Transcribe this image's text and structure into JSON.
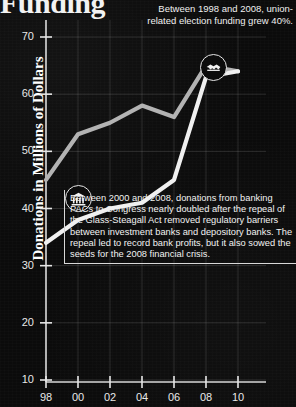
{
  "title": "Funding",
  "chart_data": {
    "type": "line",
    "title": "Funding",
    "xlabel": "",
    "ylabel": "Donations in Millions of Dollars",
    "x": [
      "98",
      "00",
      "02",
      "04",
      "06",
      "08",
      "10"
    ],
    "xtick_labels": [
      "98",
      "00",
      "02",
      "04",
      "06",
      "08",
      "10"
    ],
    "ytick_labels": [
      "70",
      "60",
      "50",
      "40",
      "30",
      "20",
      "10"
    ],
    "ylim": [
      10,
      70
    ],
    "grid": true,
    "legend": "none",
    "series": [
      {
        "name": "union-related election funding",
        "color": "#b3b3b3",
        "values": [
          45,
          53,
          55,
          58,
          56,
          65,
          64
        ]
      },
      {
        "name": "banking PAC donations to Congress",
        "color": "#f0f0f0",
        "values": [
          34,
          38,
          40,
          41,
          45,
          63,
          64
        ]
      }
    ],
    "annotations": [
      {
        "id": "union-note",
        "icon": "handshake-icon",
        "text": "Between 1998 and 2008, union-related election funding grew 40%."
      },
      {
        "id": "banking-note",
        "icon": "bank-icon",
        "text": "Between 2000 and 2008, donations from banking PACs to Congress nearly doubled after the repeal of the Glass-Steagall Act removed regulatory barriers between investment banks and depository banks. The repeal led to record bank profits, but it also sowed the seeds for the 2008 financial crisis."
      }
    ]
  },
  "axis": {
    "y_label": "Donations in Millions of Dollars"
  }
}
